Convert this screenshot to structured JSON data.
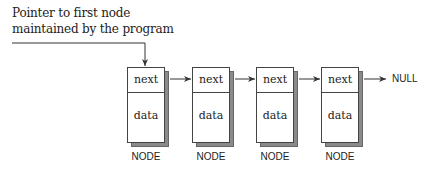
{
  "diagram": {
    "type": "singly-linked-list",
    "caption": {
      "line1": "Pointer to first node",
      "line2": "maintained by the program"
    },
    "nodes": [
      {
        "next_label": "next",
        "data_label": "data",
        "caption": "NODE"
      },
      {
        "next_label": "next",
        "data_label": "data",
        "caption": "NODE"
      },
      {
        "next_label": "next",
        "data_label": "data",
        "caption": "NODE"
      },
      {
        "next_label": "next",
        "data_label": "data",
        "caption": "NODE"
      }
    ],
    "terminator": "NULL",
    "colors": {
      "stroke": "#444444",
      "shadow": "#8a8a8a",
      "text": "#222222",
      "background": "#ffffff"
    }
  }
}
